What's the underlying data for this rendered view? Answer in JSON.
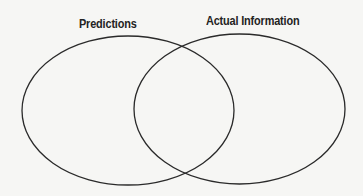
{
  "diagram": {
    "type": "venn",
    "sets": [
      {
        "id": "predictions",
        "label": "Predictions",
        "shape": "ellipse",
        "cx": 128,
        "cy": 110.5,
        "rx": 106,
        "ry": 74.5
      },
      {
        "id": "actual-information",
        "label": "Actual Information",
        "shape": "ellipse",
        "cx": 239.5,
        "cy": 109,
        "rx": 105.5,
        "ry": 75
      }
    ],
    "colors": {
      "background": "#f6f6f4",
      "stroke": "#2a2a2a",
      "label": "#232323"
    }
  }
}
